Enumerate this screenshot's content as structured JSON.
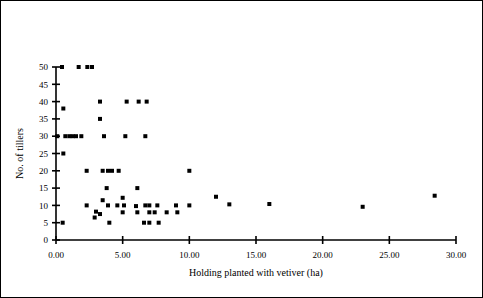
{
  "figure": {
    "border": true,
    "background": "#ffffff",
    "ink": "#000000"
  },
  "chart_data": {
    "type": "scatter",
    "title": "",
    "xlabel": "Holding planted with vetiver (ha)",
    "ylabel": "No. of tillers",
    "xlim": [
      0,
      30
    ],
    "ylim": [
      0,
      50
    ],
    "grid": false,
    "legend": null,
    "xticks": [
      0,
      5,
      10,
      15,
      20,
      25,
      30
    ],
    "xticklabels": [
      "0.00",
      "5.00",
      "10.00",
      "15.00",
      "20.00",
      "25.00",
      "30.00"
    ],
    "yticks": [
      0,
      5,
      10,
      15,
      20,
      25,
      30,
      35,
      40,
      45,
      50
    ],
    "yticklabels": [
      "0",
      "5",
      "10",
      "15",
      "20",
      "25",
      "30",
      "35",
      "40",
      "45",
      "50"
    ],
    "marker": "square",
    "marker_size": 4,
    "marker_color": "#000000",
    "points": [
      [
        0.45,
        50
      ],
      [
        1.7,
        50
      ],
      [
        2.35,
        50
      ],
      [
        2.7,
        50
      ],
      [
        0.55,
        38
      ],
      [
        3.3,
        40
      ],
      [
        5.3,
        40
      ],
      [
        6.2,
        40
      ],
      [
        6.8,
        40
      ],
      [
        3.3,
        35
      ],
      [
        0.1,
        30
      ],
      [
        0.7,
        30
      ],
      [
        1.0,
        30
      ],
      [
        1.25,
        30
      ],
      [
        1.5,
        30
      ],
      [
        1.9,
        30
      ],
      [
        3.6,
        30
      ],
      [
        5.2,
        30
      ],
      [
        6.7,
        30
      ],
      [
        0.55,
        25
      ],
      [
        2.3,
        20
      ],
      [
        3.5,
        20
      ],
      [
        3.9,
        20
      ],
      [
        4.2,
        20
      ],
      [
        4.7,
        20
      ],
      [
        10.0,
        20
      ],
      [
        3.8,
        15
      ],
      [
        6.1,
        15
      ],
      [
        12.0,
        12.5
      ],
      [
        28.4,
        12.8
      ],
      [
        3.5,
        11.5
      ],
      [
        5.0,
        12.2
      ],
      [
        2.3,
        10
      ],
      [
        3.9,
        10
      ],
      [
        4.6,
        10
      ],
      [
        5.1,
        10
      ],
      [
        6.0,
        9.8
      ],
      [
        6.7,
        10
      ],
      [
        7.0,
        10
      ],
      [
        7.6,
        10
      ],
      [
        9.0,
        10
      ],
      [
        10.0,
        10
      ],
      [
        13.0,
        10.3
      ],
      [
        16.0,
        10.4
      ],
      [
        23.0,
        9.6
      ],
      [
        3.0,
        8.2
      ],
      [
        3.3,
        7.5
      ],
      [
        5.0,
        8
      ],
      [
        6.1,
        8
      ],
      [
        7.0,
        8
      ],
      [
        7.4,
        8
      ],
      [
        8.3,
        8
      ],
      [
        9.1,
        8
      ],
      [
        2.9,
        6.5
      ],
      [
        0.5,
        5
      ],
      [
        4.0,
        5
      ],
      [
        6.6,
        5
      ],
      [
        7.0,
        5
      ],
      [
        7.7,
        5
      ]
    ]
  }
}
